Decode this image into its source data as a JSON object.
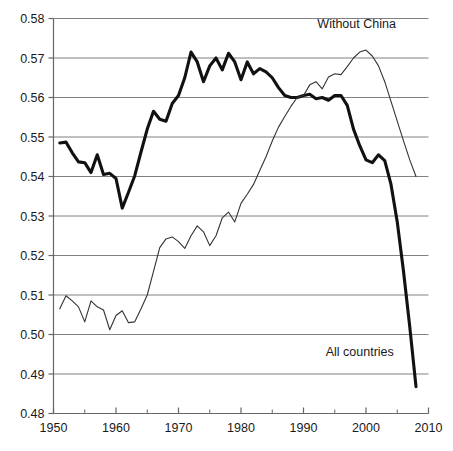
{
  "chart_data": {
    "type": "line",
    "title": "",
    "subtitle": "",
    "xlabel": "",
    "ylabel": "",
    "xlim": [
      1950,
      2010
    ],
    "ylim": [
      0.48,
      0.58
    ],
    "grid": true,
    "grid_axis": "y",
    "legend_position": "inline-annotation",
    "x_ticks": [
      1950,
      1960,
      1970,
      1980,
      1990,
      2000,
      2010
    ],
    "x_tick_labels": [
      "1950",
      "1960",
      "1970",
      "1980",
      "1990",
      "2000",
      "2010"
    ],
    "x_minor_ticks": [
      1955,
      1965,
      1975,
      1985,
      1995,
      2005
    ],
    "y_ticks": [
      0.48,
      0.49,
      0.5,
      0.51,
      0.52,
      0.53,
      0.54,
      0.55,
      0.56,
      0.57,
      0.58
    ],
    "y_tick_labels": [
      "0.48",
      "0.49",
      "0.50",
      "0.51",
      "0.52",
      "0.53",
      "0.54",
      "0.55",
      "0.56",
      "0.57",
      "0.58"
    ],
    "annotations": [
      {
        "text": "Without China",
        "x": 1998.5,
        "y": 0.5775,
        "anchor": "middle"
      },
      {
        "text": "All countries",
        "x": 1999.0,
        "y": 0.4945,
        "anchor": "middle"
      }
    ],
    "series": [
      {
        "name": "All countries",
        "color": "#111111",
        "line_width": 3.1,
        "x": [
          1951,
          1952,
          1953,
          1954,
          1955,
          1956,
          1957,
          1958,
          1959,
          1960,
          1961,
          1962,
          1963,
          1964,
          1965,
          1966,
          1967,
          1968,
          1969,
          1970,
          1971,
          1972,
          1973,
          1974,
          1975,
          1976,
          1977,
          1978,
          1979,
          1980,
          1981,
          1982,
          1983,
          1984,
          1985,
          1986,
          1987,
          1988,
          1989,
          1990,
          1991,
          1992,
          1993,
          1994,
          1995,
          1996,
          1997,
          1998,
          1999,
          2000,
          2001,
          2002,
          2003,
          2004,
          2005,
          2006,
          2007,
          2008
        ],
        "values": [
          0.5485,
          0.5487,
          0.546,
          0.5437,
          0.5435,
          0.541,
          0.5455,
          0.5405,
          0.5408,
          0.5395,
          0.532,
          0.536,
          0.5402,
          0.5462,
          0.552,
          0.5565,
          0.5545,
          0.554,
          0.5585,
          0.5605,
          0.565,
          0.5715,
          0.569,
          0.564,
          0.568,
          0.57,
          0.567,
          0.5712,
          0.569,
          0.5645,
          0.569,
          0.566,
          0.5673,
          0.5665,
          0.565,
          0.5625,
          0.5605,
          0.56,
          0.56,
          0.5605,
          0.5608,
          0.5597,
          0.56,
          0.5593,
          0.5605,
          0.5605,
          0.558,
          0.552,
          0.5478,
          0.5442,
          0.5435,
          0.5455,
          0.544,
          0.538,
          0.5285,
          0.516,
          0.502,
          0.4868
        ]
      },
      {
        "name": "Without China",
        "color": "#333333",
        "line_width": 1.1,
        "x": [
          1951,
          1952,
          1953,
          1954,
          1955,
          1956,
          1957,
          1958,
          1959,
          1960,
          1961,
          1962,
          1963,
          1964,
          1965,
          1966,
          1967,
          1968,
          1969,
          1970,
          1971,
          1972,
          1973,
          1974,
          1975,
          1976,
          1977,
          1978,
          1979,
          1980,
          1981,
          1982,
          1983,
          1984,
          1985,
          1986,
          1987,
          1988,
          1989,
          1990,
          1991,
          1992,
          1993,
          1994,
          1995,
          1996,
          1997,
          1998,
          1999,
          2000,
          2001,
          2002,
          2003,
          2004,
          2005,
          2006,
          2007,
          2008
        ],
        "values": [
          0.5065,
          0.5098,
          0.5085,
          0.507,
          0.5032,
          0.5085,
          0.507,
          0.5062,
          0.5012,
          0.5048,
          0.506,
          0.503,
          0.5032,
          0.5065,
          0.51,
          0.516,
          0.522,
          0.5242,
          0.5247,
          0.5235,
          0.5218,
          0.525,
          0.5275,
          0.526,
          0.5225,
          0.525,
          0.5295,
          0.531,
          0.5285,
          0.5332,
          0.5355,
          0.538,
          0.5415,
          0.545,
          0.549,
          0.5525,
          0.5552,
          0.5578,
          0.56,
          0.5605,
          0.5632,
          0.564,
          0.5622,
          0.5652,
          0.566,
          0.5658,
          0.5678,
          0.57,
          0.5715,
          0.572,
          0.5705,
          0.568,
          0.564,
          0.559,
          0.554,
          0.549,
          0.5442,
          0.54
        ]
      }
    ]
  },
  "axes": {
    "gridline_color": "#808080",
    "axis_color": "#666666",
    "background": "#ffffff"
  }
}
